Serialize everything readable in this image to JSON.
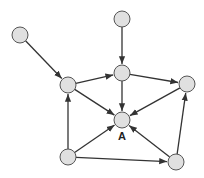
{
  "diagram": {
    "type": "directed-graph",
    "colors": {
      "node_fill": "#e0e0e0",
      "node_stroke": "#555555",
      "edge": "#333333"
    },
    "node_radius": 8,
    "nodes": [
      {
        "id": "n_topleft",
        "x": 20,
        "y": 35,
        "label": ""
      },
      {
        "id": "n_top",
        "x": 122,
        "y": 19,
        "label": ""
      },
      {
        "id": "n_midleft",
        "x": 68,
        "y": 85,
        "label": ""
      },
      {
        "id": "n_uppermid",
        "x": 122,
        "y": 73,
        "label": ""
      },
      {
        "id": "n_right",
        "x": 187,
        "y": 84,
        "label": ""
      },
      {
        "id": "A",
        "x": 122,
        "y": 120,
        "label": "A"
      },
      {
        "id": "n_botleft",
        "x": 68,
        "y": 157,
        "label": ""
      },
      {
        "id": "n_botright",
        "x": 176,
        "y": 162,
        "label": ""
      }
    ],
    "edges": [
      {
        "from": "n_topleft",
        "to": "n_midleft"
      },
      {
        "from": "n_top",
        "to": "n_uppermid"
      },
      {
        "from": "n_midleft",
        "to": "n_uppermid"
      },
      {
        "from": "n_uppermid",
        "to": "n_right"
      },
      {
        "from": "n_uppermid",
        "to": "A"
      },
      {
        "from": "n_midleft",
        "to": "A"
      },
      {
        "from": "n_right",
        "to": "A"
      },
      {
        "from": "n_botleft",
        "to": "n_midleft"
      },
      {
        "from": "n_botleft",
        "to": "A"
      },
      {
        "from": "n_botleft",
        "to": "n_botright"
      },
      {
        "from": "n_botright",
        "to": "A"
      },
      {
        "from": "n_botright",
        "to": "n_right"
      }
    ],
    "label_A": "A"
  }
}
